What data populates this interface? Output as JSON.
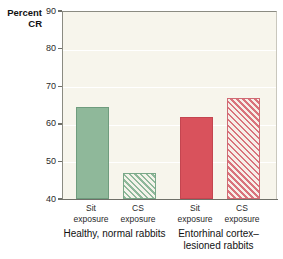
{
  "chart_data": {
    "type": "bar",
    "title": "",
    "xlabel": "",
    "ylabel": "Percent CR",
    "ylabel_line1": "Percent",
    "ylabel_line2": "CR",
    "ylim": [
      40,
      90
    ],
    "yticks": [
      90,
      80,
      70,
      60,
      50,
      40
    ],
    "ytick_labels": [
      "90",
      "80",
      "70",
      "60",
      "50",
      "40"
    ],
    "grid": true,
    "legend": "none",
    "categories": [
      "Sit exposure",
      "CS exposure",
      "Sit exposure",
      "CS exposure"
    ],
    "values": [
      64.5,
      47.0,
      61.8,
      67.0
    ],
    "bars": [
      {
        "label_line1": "Sit",
        "label_line2": "exposure",
        "value": 64.5,
        "style": "solid-green",
        "color": "#8fb89a"
      },
      {
        "label_line1": "CS",
        "label_line2": "exposure",
        "value": 47.0,
        "style": "hatch-green",
        "color": "#8fb89a"
      },
      {
        "label_line1": "Sit",
        "label_line2": "exposure",
        "value": 61.8,
        "style": "solid-red",
        "color": "#d9525c"
      },
      {
        "label_line1": "CS",
        "label_line2": "exposure",
        "value": 67.0,
        "style": "hatch-red",
        "color": "#d9525c"
      }
    ],
    "groups": [
      {
        "line1": "Healthy, normal rabbits",
        "line2": ""
      },
      {
        "line1": "Entorhinal cortex–",
        "line2": "lesioned rabbits"
      }
    ],
    "colors": {
      "green": "#8fb89a",
      "red": "#d9525c",
      "plot_background": "#f7f5ec",
      "gridline": "#ffffff",
      "axis": "#6f6f68",
      "text": "#1a1a1a"
    }
  }
}
